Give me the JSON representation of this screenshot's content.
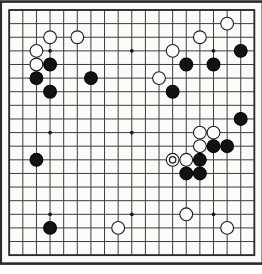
{
  "app": {
    "title": "Go Board Position",
    "board_type": "go-board",
    "size": 19
  },
  "board": {
    "columns": 19,
    "rows": 19,
    "origin_x": 9.2,
    "origin_y": 10.0,
    "spacing": 13.62,
    "line_color": "#3c3c3c",
    "border_color": "#2b2b2b",
    "border_width": 2.6,
    "line_width": 1.0,
    "background_color": "#fbfbf9",
    "star_point_color": "#1a1a1a",
    "star_point_radius": 1.9,
    "star_points": [
      [
        3,
        3
      ],
      [
        9,
        3
      ],
      [
        15,
        3
      ],
      [
        3,
        9
      ],
      [
        9,
        9
      ],
      [
        15,
        9
      ],
      [
        3,
        15
      ],
      [
        9,
        15
      ],
      [
        15,
        15
      ]
    ]
  },
  "stones": {
    "black_fill": "#121212",
    "black_stroke": "#000000",
    "white_fill": "#fcfcfc",
    "white_stroke": "#1d1d1d",
    "radius": 6.4,
    "stroke_width": 1.1,
    "marker_color": "#1d1d1d",
    "marker_radius": 3.2,
    "list": [
      {
        "color": "white",
        "col": 3,
        "row": 2,
        "marked": false
      },
      {
        "color": "white",
        "col": 5,
        "row": 2,
        "marked": false
      },
      {
        "color": "white",
        "col": 2,
        "row": 3,
        "marked": false
      },
      {
        "color": "white",
        "col": 2,
        "row": 4,
        "marked": false
      },
      {
        "color": "black",
        "col": 3,
        "row": 4,
        "marked": false
      },
      {
        "color": "black",
        "col": 2,
        "row": 5,
        "marked": false
      },
      {
        "color": "black",
        "col": 3,
        "row": 6,
        "marked": false
      },
      {
        "color": "black",
        "col": 6,
        "row": 5,
        "marked": false
      },
      {
        "color": "white",
        "col": 16,
        "row": 1,
        "marked": false
      },
      {
        "color": "white",
        "col": 14,
        "row": 2,
        "marked": false
      },
      {
        "color": "white",
        "col": 12,
        "row": 3,
        "marked": false
      },
      {
        "color": "black",
        "col": 17,
        "row": 3,
        "marked": false
      },
      {
        "color": "black",
        "col": 15,
        "row": 4,
        "marked": false
      },
      {
        "color": "black",
        "col": 13,
        "row": 4,
        "marked": false
      },
      {
        "color": "white",
        "col": 11,
        "row": 5,
        "marked": false
      },
      {
        "color": "black",
        "col": 12,
        "row": 6,
        "marked": false
      },
      {
        "color": "black",
        "col": 17,
        "row": 8,
        "marked": false
      },
      {
        "color": "white",
        "col": 14,
        "row": 9,
        "marked": false
      },
      {
        "color": "white",
        "col": 15,
        "row": 9,
        "marked": false
      },
      {
        "color": "white",
        "col": 14,
        "row": 10,
        "marked": false
      },
      {
        "color": "black",
        "col": 15,
        "row": 10,
        "marked": false
      },
      {
        "color": "black",
        "col": 16,
        "row": 10,
        "marked": false
      },
      {
        "color": "white",
        "col": 12,
        "row": 11,
        "marked": true
      },
      {
        "color": "white",
        "col": 13,
        "row": 11,
        "marked": false
      },
      {
        "color": "black",
        "col": 14,
        "row": 11,
        "marked": false
      },
      {
        "color": "black",
        "col": 13,
        "row": 12,
        "marked": false
      },
      {
        "color": "black",
        "col": 14,
        "row": 12,
        "marked": false
      },
      {
        "color": "black",
        "col": 2,
        "row": 11,
        "marked": false
      },
      {
        "color": "white",
        "col": 13,
        "row": 15,
        "marked": false
      },
      {
        "color": "black",
        "col": 3,
        "row": 16,
        "marked": false
      },
      {
        "color": "white",
        "col": 8,
        "row": 16,
        "marked": false
      },
      {
        "color": "white",
        "col": 16,
        "row": 16,
        "marked": false
      }
    ]
  },
  "legend": {
    "black_label": "Black stone",
    "white_label": "White stone",
    "marked_label": "Last move marker"
  }
}
